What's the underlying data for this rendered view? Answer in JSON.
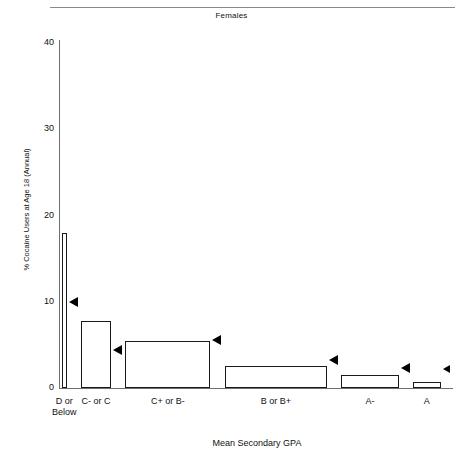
{
  "chart_data": {
    "type": "bar",
    "title": "Females",
    "xlabel": "Mean Secondary GPA",
    "ylabel": "% Cocaine Users at Age 18 (Annual)",
    "categories": [
      "D or Below",
      "C- or C",
      "C+ or B-",
      "B or B+",
      "A-",
      "A"
    ],
    "category_lines": [
      [
        "D or",
        "Below"
      ],
      [
        "C- or C"
      ],
      [
        "C+ or B-"
      ],
      [
        "B or B+"
      ],
      [
        "A-"
      ],
      [
        "A"
      ]
    ],
    "values": [
      18.0,
      7.8,
      5.4,
      2.6,
      1.5,
      0.7
    ],
    "marker_values": [
      10.0,
      4.4,
      5.6,
      3.2,
      2.3,
      2.2
    ],
    "marker_label": "left-pointing-triangle",
    "ylim": [
      0,
      40
    ],
    "yticks": [
      0,
      10,
      20,
      30,
      40
    ],
    "ytick_labels": [
      "0",
      "10",
      "20",
      "30",
      "40"
    ],
    "xlim_note": "bar widths proportional to group sample size",
    "bar_widths_pct": [
      1.2,
      7.6,
      21.5,
      26.0,
      14.5,
      7.0
    ],
    "grid": false,
    "legend": false,
    "bar_fill": "#ffffff",
    "bar_edge": "#1a1a1a",
    "marker_color": "#000000",
    "axis_color": "#6f6f6f"
  }
}
